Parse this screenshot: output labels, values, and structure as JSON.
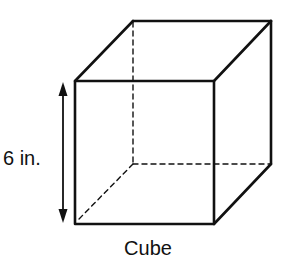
{
  "figure": {
    "shape": "Cube",
    "caption": "Cube",
    "dimension_label": "6 in.",
    "stroke_color": "#111111",
    "background": "#ffffff"
  }
}
